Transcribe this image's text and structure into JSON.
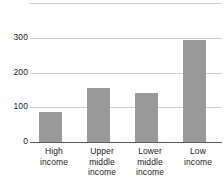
{
  "chart_data": {
    "type": "bar",
    "title": "",
    "subtitle": "",
    "xlabel": "",
    "ylabel": "",
    "categories": [
      "High income",
      "Upper middle income",
      "Lower middle income",
      "Low income"
    ],
    "category_lines": [
      [
        "High",
        "income"
      ],
      [
        "Upper",
        "middle",
        "income"
      ],
      [
        "Lower",
        "middle",
        "income"
      ],
      [
        "Low",
        "income"
      ]
    ],
    "values": [
      85,
      155,
      140,
      295
    ],
    "ylim": [
      0,
      400
    ],
    "yticks": [
      0,
      100,
      200,
      300
    ],
    "ytick_labels": [
      "0",
      "100",
      "200",
      "300"
    ],
    "gridlines": [
      0,
      100,
      200,
      300,
      400
    ],
    "grid": true,
    "legend": false,
    "legend_position": "none",
    "bar_color": "#999999",
    "gridline_color": "#cfcfcf",
    "axis_color": "#5a5a5a",
    "text_color": "#1a1a1a"
  }
}
